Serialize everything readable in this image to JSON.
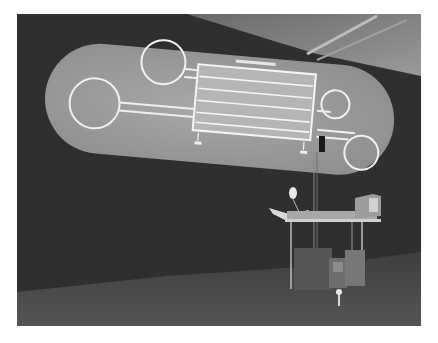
{
  "image": {
    "kind": "photograph",
    "description": "Grayscale photo of an art installation: a large pill-shaped projection on a dark gallery wall showing a track-like diagram of four circular loops connected by lines to a central table panel, with a desk holding a lamp, an open book and a CRT monitor, and equipment cases underneath.",
    "colors": {
      "wall": "#2e2e2e",
      "ceiling": "#8a8a8a",
      "floor": "#4a4a4a",
      "projection": "#9a9a9a",
      "lines": "#f2f2f2"
    }
  },
  "projection": {
    "panel_title": "",
    "panel_rows": 5
  }
}
